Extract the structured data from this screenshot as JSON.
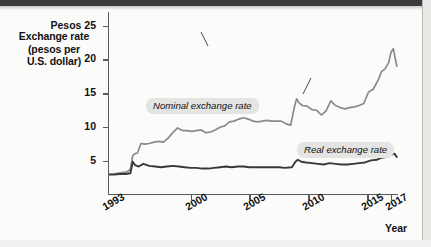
{
  "chart_data": {
    "type": "line",
    "title": "",
    "ylabel": "Exchange rate (pesos per U.S. dollar)",
    "ylabel_lines": [
      "Exchange rate",
      "(pesos per",
      "U.S. dollar)"
    ],
    "xlabel": "Year",
    "y_unit_prefix": "Pesos",
    "ylim": [
      0,
      27
    ],
    "xlim": [
      1993,
      2017.6
    ],
    "yticks": [
      5,
      10,
      15,
      20,
      25
    ],
    "ytick_labels": [
      "5",
      "10",
      "15",
      "20",
      "25"
    ],
    "top_ytick_label": "Pesos 25",
    "xticks": [
      1993,
      2000,
      2005,
      2010,
      2015,
      2017
    ],
    "xtick_labels": [
      "1993",
      "2000",
      "2005",
      "2010",
      "2015",
      "2017"
    ],
    "grid": false,
    "legend": "inline-annotations",
    "colors": {
      "nominal": "#8a8a8a",
      "real": "#383838",
      "axis": "#5a5a5a",
      "label_background": "#e4e4e2",
      "page_background": "#fbfbfa",
      "top_band": "#3c3c3c"
    },
    "series": [
      {
        "name": "Nominal exchange rate",
        "color": "#8a8a8a",
        "x": [
          1993.0,
          1993.4,
          1993.8,
          1994.2,
          1994.6,
          1994.9,
          1995.1,
          1995.3,
          1995.5,
          1995.8,
          1996.1,
          1996.5,
          1996.9,
          1997.3,
          1997.7,
          1998.1,
          1998.5,
          1998.9,
          1999.3,
          1999.7,
          2000.1,
          2000.5,
          2000.9,
          2001.3,
          2001.7,
          2002.1,
          2002.5,
          2002.9,
          2003.3,
          2003.7,
          2004.1,
          2004.5,
          2004.9,
          2005.3,
          2005.7,
          2006.1,
          2006.5,
          2006.9,
          2007.3,
          2007.7,
          2008.1,
          2008.5,
          2008.8,
          2009.0,
          2009.2,
          2009.5,
          2009.9,
          2010.3,
          2010.7,
          2011.1,
          2011.5,
          2011.9,
          2012.3,
          2012.7,
          2013.1,
          2013.5,
          2013.9,
          2014.3,
          2014.7,
          2015.1,
          2015.5,
          2015.9,
          2016.2,
          2016.5,
          2016.8,
          2017.0,
          2017.2,
          2017.5
        ],
        "y": [
          3.1,
          3.1,
          3.2,
          3.3,
          3.4,
          3.8,
          5.8,
          6.1,
          6.2,
          7.6,
          7.5,
          7.6,
          7.8,
          7.9,
          7.8,
          8.4,
          9.2,
          9.9,
          9.5,
          9.5,
          9.4,
          9.5,
          9.6,
          9.2,
          9.3,
          9.6,
          10.0,
          10.2,
          10.8,
          10.9,
          11.2,
          11.4,
          11.2,
          10.9,
          10.8,
          10.9,
          11.0,
          10.9,
          10.9,
          10.9,
          10.5,
          10.3,
          12.9,
          14.2,
          13.6,
          13.2,
          13.1,
          12.6,
          12.5,
          11.8,
          12.4,
          13.9,
          13.2,
          12.9,
          12.7,
          12.9,
          13.0,
          13.2,
          13.5,
          15.2,
          15.6,
          16.9,
          18.2,
          18.6,
          19.5,
          21.0,
          21.6,
          19.0
        ],
        "notes": "Peso crisis spike 1994-95; 2008-09 global financial crisis jump; sharp depreciation 2014-2017 peaking near 21.5"
      },
      {
        "name": "Real exchange rate",
        "color": "#383838",
        "x": [
          1993.0,
          1993.5,
          1994.0,
          1994.5,
          1994.9,
          1995.1,
          1995.3,
          1995.6,
          1996.0,
          1996.5,
          1997.0,
          1997.5,
          1998.0,
          1998.5,
          1999.0,
          1999.5,
          2000.0,
          2000.5,
          2001.0,
          2001.5,
          2002.0,
          2002.5,
          2003.0,
          2003.5,
          2004.0,
          2004.5,
          2005.0,
          2005.5,
          2006.0,
          2006.5,
          2007.0,
          2007.5,
          2008.0,
          2008.6,
          2008.9,
          2009.1,
          2009.4,
          2009.8,
          2010.3,
          2010.8,
          2011.3,
          2011.8,
          2012.3,
          2012.8,
          2013.3,
          2013.8,
          2014.3,
          2014.8,
          2015.3,
          2015.8,
          2016.2,
          2016.6,
          2017.0,
          2017.3,
          2017.5
        ],
        "y": [
          3.0,
          3.0,
          3.1,
          3.1,
          3.2,
          4.9,
          4.4,
          4.2,
          4.6,
          4.3,
          4.2,
          4.1,
          4.2,
          4.3,
          4.2,
          4.1,
          4.0,
          4.0,
          3.9,
          3.9,
          4.0,
          4.1,
          4.2,
          4.1,
          4.2,
          4.2,
          4.1,
          4.1,
          4.1,
          4.1,
          4.1,
          4.1,
          4.0,
          4.1,
          4.9,
          5.2,
          4.9,
          4.8,
          4.7,
          4.6,
          4.5,
          4.7,
          4.6,
          4.5,
          4.5,
          4.6,
          4.7,
          4.8,
          5.1,
          5.2,
          5.5,
          5.6,
          5.9,
          6.1,
          5.6
        ],
        "notes": "Inflation-adjusted; far flatter, rising modestly to about 6 by 2017"
      }
    ],
    "annotations": [
      {
        "text": "Nominal exchange rate",
        "target_series": "Nominal exchange rate",
        "target_x": 2003.0
      },
      {
        "text": "Real exchange rate",
        "target_series": "Real exchange rate",
        "target_x": 2012.3
      }
    ]
  }
}
